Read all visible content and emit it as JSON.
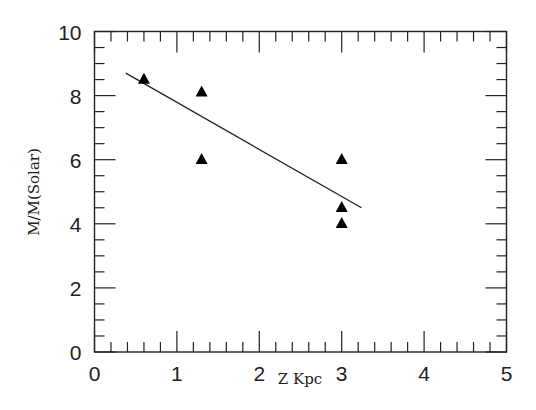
{
  "chart_data": {
    "type": "scatter",
    "title": "",
    "xlabel": "Z Kpc",
    "ylabel": "M/M(Solar)",
    "xlim": [
      0,
      5
    ],
    "ylim": [
      0,
      10
    ],
    "x_ticks": [
      0,
      1,
      2,
      3,
      4,
      5
    ],
    "y_ticks": [
      0,
      2,
      4,
      6,
      8,
      10
    ],
    "x_minor_step": 0.2,
    "y_minor_step": 0.5,
    "grid": false,
    "legend": null,
    "series": [
      {
        "name": "data",
        "marker": "filled-triangle",
        "points": [
          {
            "x": 0.6,
            "y": 8.5
          },
          {
            "x": 1.3,
            "y": 8.1
          },
          {
            "x": 1.3,
            "y": 6.0
          },
          {
            "x": 3.0,
            "y": 6.0
          },
          {
            "x": 3.0,
            "y": 4.5
          },
          {
            "x": 3.0,
            "y": 4.0
          }
        ]
      },
      {
        "name": "linear fit",
        "type": "line",
        "points": [
          {
            "x": 0.38,
            "y": 8.7
          },
          {
            "x": 3.24,
            "y": 4.5
          }
        ]
      }
    ]
  }
}
